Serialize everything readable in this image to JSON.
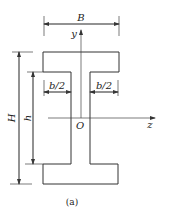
{
  "figure": {
    "caption": "(a)",
    "shape": "I-section (wide flange)",
    "labels": {
      "B": "B",
      "H": "H",
      "h": "h",
      "b_half_left": "b/2",
      "b_half_right": "b/2",
      "y_axis": "y",
      "z_axis": "z",
      "origin": "O"
    },
    "colors": {
      "line": "#333333",
      "background": "#ffffff"
    }
  }
}
